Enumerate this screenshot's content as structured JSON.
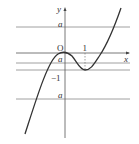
{
  "figure": {
    "type": "graph",
    "axes": {
      "x_label": "x",
      "y_label": "y",
      "origin_label": "O"
    },
    "tick_labels": {
      "x_one": "1",
      "y_minus_one": "−1"
    },
    "horizontal_lines": [
      {
        "label": "a",
        "position": "above origin"
      },
      {
        "label": "a",
        "position": "between 0 and -1"
      },
      {
        "label": "a",
        "position": "below -1"
      }
    ],
    "curve": {
      "local_max": {
        "x": 0,
        "y": 0
      },
      "local_min": {
        "x": 1,
        "y": -1
      }
    },
    "colors": {
      "curve": "#333333",
      "lines": "#777777",
      "text": "#333333"
    }
  }
}
